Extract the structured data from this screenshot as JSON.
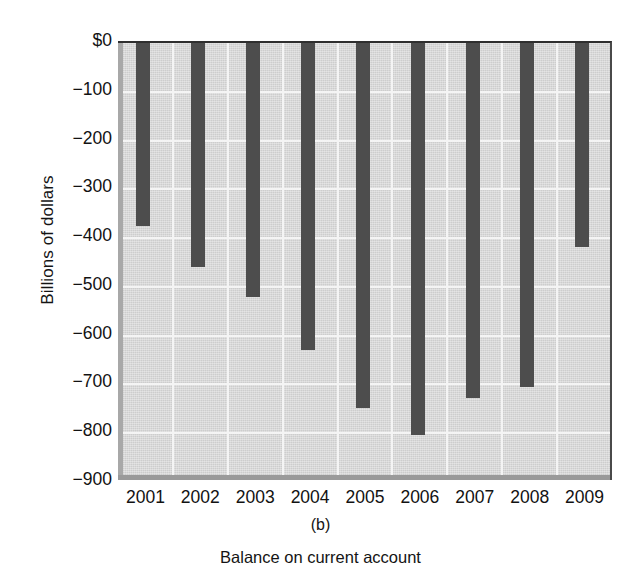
{
  "chart_data": {
    "type": "bar",
    "title": "",
    "subtitle": "",
    "panel_label": "(b)",
    "caption": "Balance on current account",
    "xlabel": "",
    "ylabel": "Billions of dollars",
    "categories": [
      "2001",
      "2002",
      "2003",
      "2004",
      "2005",
      "2006",
      "2007",
      "2008",
      "2009"
    ],
    "values": [
      -375,
      -460,
      -520,
      -630,
      -748,
      -803,
      -727,
      -706,
      -418
    ],
    "series": [
      {
        "name": "Balance on current account",
        "values": [
          -375,
          -460,
          -520,
          -630,
          -748,
          -803,
          -727,
          -706,
          -418
        ]
      }
    ],
    "ylim": [
      -900,
      0
    ],
    "xlim": [
      0,
      9
    ],
    "ytick_values": [
      0,
      -100,
      -200,
      -300,
      -400,
      -500,
      -600,
      -700,
      -800,
      -900
    ],
    "ytick_labels": [
      "$0",
      "−100",
      "−200",
      "−300",
      "−400",
      "−500",
      "−600",
      "−700",
      "−800",
      "−900"
    ],
    "xtick_labels": [
      "2001",
      "2002",
      "2003",
      "2004",
      "2005",
      "2006",
      "2007",
      "2008",
      "2009"
    ],
    "grid": true,
    "grid_color": "#f4f4f4",
    "legend": false,
    "legend_position": "none",
    "bar_color": "#4d4d4d",
    "plot_background": "#cdcdcd",
    "page_background": "#ffffff",
    "units": "Billions of dollars"
  }
}
